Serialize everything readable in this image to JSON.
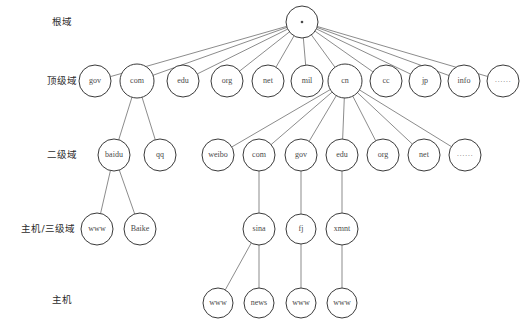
{
  "figure": {
    "background_color": "#ffffff",
    "node_fill": "#ffffff",
    "node_stroke": "#3a3a3a",
    "edge_color": "#5a5a5a",
    "text_color": "#4a4a4a"
  },
  "rows": [
    {
      "id": "root",
      "label": "根域",
      "y": 22,
      "label_x": 62
    },
    {
      "id": "tld",
      "label": "顶级域",
      "y": 81,
      "label_x": 62
    },
    {
      "id": "sld",
      "label": "二级域",
      "y": 155,
      "label_x": 62
    },
    {
      "id": "host3",
      "label": "主机/三级域",
      "y": 229,
      "label_x": 48
    },
    {
      "id": "host",
      "label": "主机",
      "y": 300,
      "label_x": 62
    }
  ],
  "nodes": [
    {
      "id": "root",
      "label": "·",
      "x": 302,
      "y": 22,
      "r": 16,
      "row": "root",
      "is_root": true
    },
    {
      "id": "tld-gov",
      "label": "gov",
      "x": 95,
      "y": 81,
      "r": 16,
      "row": "tld"
    },
    {
      "id": "tld-com",
      "label": "com",
      "x": 137,
      "y": 81,
      "r": 17,
      "row": "tld"
    },
    {
      "id": "tld-edu",
      "label": "edu",
      "x": 183,
      "y": 81,
      "r": 16,
      "row": "tld"
    },
    {
      "id": "tld-org",
      "label": "org",
      "x": 227,
      "y": 81,
      "r": 16,
      "row": "tld"
    },
    {
      "id": "tld-net",
      "label": "net",
      "x": 268,
      "y": 81,
      "r": 16,
      "row": "tld"
    },
    {
      "id": "tld-mil",
      "label": "mil",
      "x": 307,
      "y": 81,
      "r": 16,
      "row": "tld"
    },
    {
      "id": "tld-cn",
      "label": "cn",
      "x": 345,
      "y": 81,
      "r": 17,
      "row": "tld"
    },
    {
      "id": "tld-cc",
      "label": "cc",
      "x": 386,
      "y": 81,
      "r": 16,
      "row": "tld"
    },
    {
      "id": "tld-jp",
      "label": "jp",
      "x": 425,
      "y": 81,
      "r": 16,
      "row": "tld"
    },
    {
      "id": "tld-info",
      "label": "info",
      "x": 464,
      "y": 81,
      "r": 16,
      "row": "tld"
    },
    {
      "id": "tld-more",
      "label": "······",
      "x": 503,
      "y": 81,
      "r": 16,
      "row": "tld",
      "is_ellipsis": true
    },
    {
      "id": "sld-baidu",
      "label": "baidu",
      "x": 114,
      "y": 155,
      "r": 16,
      "row": "sld"
    },
    {
      "id": "sld-qq",
      "label": "qq",
      "x": 160,
      "y": 155,
      "r": 16,
      "row": "sld"
    },
    {
      "id": "sld-weibo",
      "label": "weibo",
      "x": 218,
      "y": 155,
      "r": 16,
      "row": "sld"
    },
    {
      "id": "sld-com",
      "label": "com",
      "x": 259,
      "y": 155,
      "r": 16,
      "row": "sld"
    },
    {
      "id": "sld-gov",
      "label": "gov",
      "x": 301,
      "y": 155,
      "r": 16,
      "row": "sld"
    },
    {
      "id": "sld-edu",
      "label": "edu",
      "x": 342,
      "y": 155,
      "r": 16,
      "row": "sld"
    },
    {
      "id": "sld-org",
      "label": "org",
      "x": 383,
      "y": 155,
      "r": 16,
      "row": "sld"
    },
    {
      "id": "sld-net",
      "label": "net",
      "x": 424,
      "y": 155,
      "r": 16,
      "row": "sld"
    },
    {
      "id": "sld-more",
      "label": "······",
      "x": 465,
      "y": 155,
      "r": 16,
      "row": "sld",
      "is_ellipsis": true
    },
    {
      "id": "h3-www",
      "label": "www",
      "x": 97,
      "y": 229,
      "r": 16,
      "row": "host3"
    },
    {
      "id": "h3-baike",
      "label": "Baike",
      "x": 140,
      "y": 229,
      "r": 16,
      "row": "host3"
    },
    {
      "id": "h3-sina",
      "label": "sina",
      "x": 259,
      "y": 229,
      "r": 16,
      "row": "host3"
    },
    {
      "id": "h3-fj",
      "label": "fj",
      "x": 301,
      "y": 229,
      "r": 15,
      "row": "host3"
    },
    {
      "id": "h3-xmnt",
      "label": "xmnt",
      "x": 342,
      "y": 229,
      "r": 16,
      "row": "host3"
    },
    {
      "id": "h-www1",
      "label": "www",
      "x": 218,
      "y": 303,
      "r": 15,
      "row": "host"
    },
    {
      "id": "h-news",
      "label": "news",
      "x": 259,
      "y": 303,
      "r": 15,
      "row": "host"
    },
    {
      "id": "h-www2",
      "label": "www",
      "x": 301,
      "y": 303,
      "r": 15,
      "row": "host"
    },
    {
      "id": "h-www3",
      "label": "www",
      "x": 342,
      "y": 303,
      "r": 15,
      "row": "host"
    }
  ],
  "edges": [
    {
      "from": "root",
      "to": "tld-gov"
    },
    {
      "from": "root",
      "to": "tld-com"
    },
    {
      "from": "root",
      "to": "tld-edu"
    },
    {
      "from": "root",
      "to": "tld-org"
    },
    {
      "from": "root",
      "to": "tld-net"
    },
    {
      "from": "root",
      "to": "tld-mil"
    },
    {
      "from": "root",
      "to": "tld-cn"
    },
    {
      "from": "root",
      "to": "tld-cc"
    },
    {
      "from": "root",
      "to": "tld-jp"
    },
    {
      "from": "root",
      "to": "tld-info"
    },
    {
      "from": "root",
      "to": "tld-more"
    },
    {
      "from": "tld-com",
      "to": "sld-baidu"
    },
    {
      "from": "tld-com",
      "to": "sld-qq"
    },
    {
      "from": "tld-cn",
      "to": "sld-weibo"
    },
    {
      "from": "tld-cn",
      "to": "sld-com"
    },
    {
      "from": "tld-cn",
      "to": "sld-gov"
    },
    {
      "from": "tld-cn",
      "to": "sld-edu"
    },
    {
      "from": "tld-cn",
      "to": "sld-org"
    },
    {
      "from": "tld-cn",
      "to": "sld-net"
    },
    {
      "from": "tld-cn",
      "to": "sld-more"
    },
    {
      "from": "sld-baidu",
      "to": "h3-www"
    },
    {
      "from": "sld-baidu",
      "to": "h3-baike"
    },
    {
      "from": "sld-com",
      "to": "h3-sina"
    },
    {
      "from": "sld-gov",
      "to": "h3-fj"
    },
    {
      "from": "sld-edu",
      "to": "h3-xmnt"
    },
    {
      "from": "h3-sina",
      "to": "h-www1"
    },
    {
      "from": "h3-sina",
      "to": "h-news"
    },
    {
      "from": "h3-fj",
      "to": "h-www2"
    },
    {
      "from": "h3-xmnt",
      "to": "h-www3"
    }
  ]
}
